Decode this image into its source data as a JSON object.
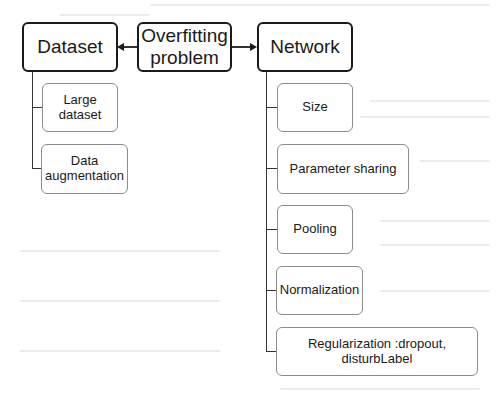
{
  "diagram": {
    "root": {
      "label": "Overfitting\nproblem"
    },
    "branches": [
      {
        "label": "Dataset",
        "children": [
          {
            "label": "Large\ndataset"
          },
          {
            "label": "Data\naugmentation"
          }
        ]
      },
      {
        "label": "Network",
        "children": [
          {
            "label": "Size"
          },
          {
            "label": "Parameter sharing"
          },
          {
            "label": "Pooling"
          },
          {
            "label": "Normalization"
          },
          {
            "label": "Regularization :dropout,\ndisturbLabel"
          }
        ]
      }
    ]
  },
  "colors": {
    "main_border": "#1a1a1a",
    "sub_border": "#8c8c8c",
    "connector": "#333333",
    "background": "#ffffff"
  }
}
